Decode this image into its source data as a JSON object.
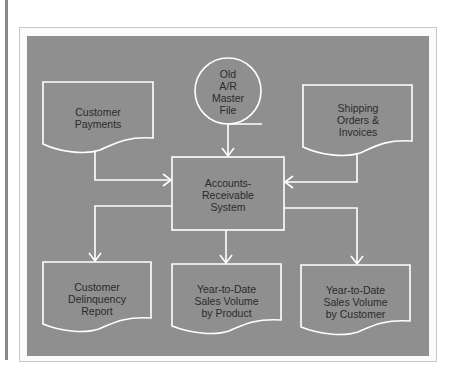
{
  "diagram": {
    "type": "data-flow",
    "colors": {
      "panel": "#8f8f8f",
      "stroke": "#ffffff",
      "text": "#2b2b2b"
    },
    "nodes": {
      "old_ar_master_file": {
        "shape": "circle",
        "label": "Old\nA/R\nMaster\nFile"
      },
      "customer_payments": {
        "shape": "document",
        "label": "Customer\nPayments"
      },
      "shipping_orders": {
        "shape": "document",
        "label": "Shipping\nOrders &\nInvoices"
      },
      "ar_system": {
        "shape": "process",
        "label": "Accounts-\nReceivable\nSystem"
      },
      "delinquency_report": {
        "shape": "document",
        "label": "Customer\nDelinquency\nReport"
      },
      "sales_by_product": {
        "shape": "document",
        "label": "Year-to-Date\nSales Volume\nby Product"
      },
      "sales_by_customer": {
        "shape": "document",
        "label": "Year-to-Date\nSales Volume\nby Customer"
      }
    },
    "edges": [
      {
        "from": "old_ar_master_file",
        "to": "ar_system"
      },
      {
        "from": "customer_payments",
        "to": "ar_system"
      },
      {
        "from": "shipping_orders",
        "to": "ar_system"
      },
      {
        "from": "ar_system",
        "to": "delinquency_report"
      },
      {
        "from": "ar_system",
        "to": "sales_by_product"
      },
      {
        "from": "ar_system",
        "to": "sales_by_customer"
      }
    ]
  }
}
